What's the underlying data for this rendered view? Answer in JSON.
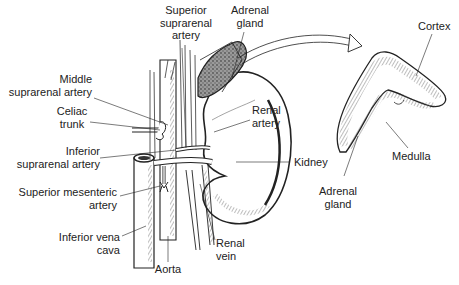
{
  "diagram": {
    "type": "anatomical-illustration",
    "colors": {
      "ink": "#222222",
      "gland_fill": "#9a9a9a",
      "background": "#ffffff"
    }
  },
  "labels": {
    "superior_suprarenal_artery": [
      "Superior",
      "suprarenal",
      "artery"
    ],
    "adrenal_gland_top": [
      "Adrenal",
      "gland"
    ],
    "middle_suprarenal_artery": [
      "Middle",
      "suprarenal artery"
    ],
    "celiac_trunk": [
      "Celiac",
      "trunk"
    ],
    "renal_artery": [
      "Renal",
      "artery"
    ],
    "inferior_suprarenal_artery": [
      "Inferior",
      "suprarenal artery"
    ],
    "kidney": "Kidney",
    "superior_mesenteric_artery": [
      "Superior mesenteric",
      "artery"
    ],
    "inferior_vena_cava": [
      "Inferior vena",
      "cava"
    ],
    "aorta": "Aorta",
    "renal_vein": [
      "Renal",
      "vein"
    ],
    "cortex": "Cortex",
    "medulla": "Medulla",
    "adrenal_gland_section": [
      "Adrenal",
      "gland"
    ]
  }
}
